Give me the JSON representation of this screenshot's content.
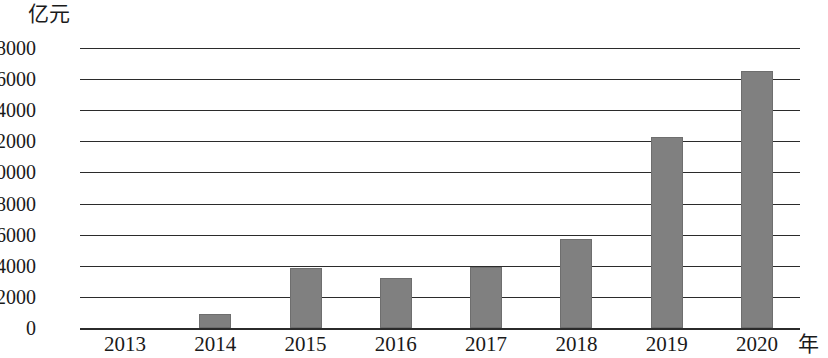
{
  "chart_data": {
    "type": "bar",
    "title": "",
    "subtitle": "",
    "unit_label": "亿元",
    "xlabel": "年",
    "ylabel": "",
    "categories": [
      "2013",
      "2014",
      "2015",
      "2016",
      "2017",
      "2018",
      "2019",
      "2020"
    ],
    "values": [
      0,
      900,
      3850,
      3200,
      3950,
      5750,
      12300,
      16500
    ],
    "series": [
      {
        "name": "亿元",
        "values": [
          0,
          900,
          3850,
          3200,
          3950,
          5750,
          12300,
          16500
        ]
      }
    ],
    "ylim": [
      0,
      18000
    ],
    "ytick_values": [
      0,
      2000,
      4000,
      6000,
      8000,
      10000,
      12000,
      14000,
      16000,
      18000
    ],
    "ytick_labels": [
      "0",
      "2000",
      "4000",
      "6000",
      "8000",
      "10000",
      "12000",
      "14000",
      "16000",
      "18000"
    ],
    "grid": true,
    "grid_axis": "y",
    "legend": false,
    "legend_position": "none",
    "bar_color": "#808080",
    "bar_edge_color": "#6e6e6e",
    "axis_color": "#2b2b2b",
    "background_color": "#ffffff",
    "text_color": "#1a1a1a"
  }
}
